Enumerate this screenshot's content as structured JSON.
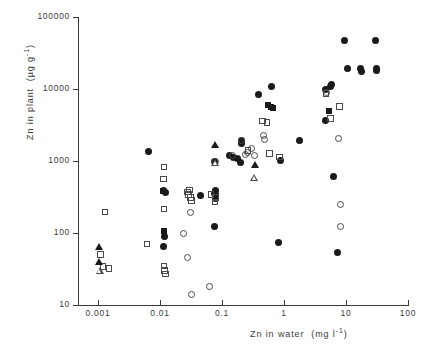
{
  "chart_data": {
    "type": "scatter",
    "title": "",
    "xlabel": "Zn in water  (mg l⁻¹)",
    "ylabel": "Zn in plant  (µg g⁻¹)",
    "xscale": "log",
    "yscale": "log",
    "xlim": [
      0.001,
      100
    ],
    "ylim": [
      10,
      100000
    ],
    "grid": false,
    "legend": "none",
    "xticks": [
      "0.001",
      "0.01",
      "0.1",
      "1",
      "10",
      "100"
    ],
    "xtick_values": [
      0.001,
      0.01,
      0.1,
      1,
      10,
      100
    ],
    "yticks": [
      "10",
      "100",
      "1000",
      "10000",
      "100000"
    ],
    "ytick_values": [
      10,
      100,
      1000,
      10000,
      100000
    ],
    "series": [
      {
        "name": "filled-circle",
        "marker": "filled circle",
        "points": [
          [
            0.0065,
            1350
          ],
          [
            0.0115,
            390
          ],
          [
            0.0122,
            370
          ],
          [
            0.0118,
            88
          ],
          [
            0.0115,
            64
          ],
          [
            0.045,
            330
          ],
          [
            0.075,
            1000
          ],
          [
            0.077,
            350
          ],
          [
            0.079,
            300
          ],
          [
            0.078,
            385
          ],
          [
            0.077,
            125
          ],
          [
            0.13,
            1180
          ],
          [
            0.155,
            1120
          ],
          [
            0.205,
            1750
          ],
          [
            0.21,
            1900
          ],
          [
            0.2,
            940
          ],
          [
            0.175,
            1100
          ],
          [
            0.39,
            8500
          ],
          [
            0.62,
            10800
          ],
          [
            0.82,
            74
          ],
          [
            0.88,
            1020
          ],
          [
            1.75,
            1950
          ],
          [
            4.6,
            9800
          ],
          [
            4.7,
            3600
          ],
          [
            5.6,
            11000
          ],
          [
            5.8,
            11400
          ],
          [
            6.2,
            600
          ],
          [
            7.4,
            53
          ],
          [
            9.5,
            47000
          ],
          [
            10.5,
            19000
          ],
          [
            17.0,
            19500
          ],
          [
            17.5,
            17500
          ],
          [
            30.0,
            47000
          ],
          [
            31.0,
            19000
          ],
          [
            31.5,
            17800
          ]
        ]
      },
      {
        "name": "open-circle",
        "marker": "open circle",
        "points": [
          [
            0.024,
            100
          ],
          [
            0.028,
            45
          ],
          [
            0.031,
            195
          ],
          [
            0.032,
            14
          ],
          [
            0.062,
            18
          ],
          [
            0.078,
            980
          ],
          [
            0.15,
            1200
          ],
          [
            0.21,
            1950
          ],
          [
            0.235,
            1250
          ],
          [
            0.26,
            1300
          ],
          [
            0.3,
            1500
          ],
          [
            0.335,
            1180
          ],
          [
            0.46,
            2250
          ],
          [
            0.48,
            2000
          ],
          [
            4.9,
            8800
          ],
          [
            7.7,
            2050
          ],
          [
            8.1,
            250
          ],
          [
            8.3,
            125
          ]
        ]
      },
      {
        "name": "filled-square",
        "marker": "filled square",
        "points": [
          [
            0.0112,
            380
          ],
          [
            0.0118,
            108
          ],
          [
            0.0795,
            330
          ],
          [
            0.55,
            5900
          ],
          [
            0.62,
            5700
          ],
          [
            0.66,
            5500
          ],
          [
            5.3,
            5000
          ]
        ]
      },
      {
        "name": "open-square",
        "marker": "open square",
        "points": [
          [
            0.0011,
            50
          ],
          [
            0.0012,
            34
          ],
          [
            0.0013,
            195
          ],
          [
            0.0015,
            32
          ],
          [
            0.0062,
            70
          ],
          [
            0.0115,
            830
          ],
          [
            0.0113,
            560
          ],
          [
            0.0116,
            215
          ],
          [
            0.0117,
            35
          ],
          [
            0.0119,
            30
          ],
          [
            0.0122,
            27
          ],
          [
            0.028,
            370
          ],
          [
            0.029,
            340
          ],
          [
            0.031,
            310
          ],
          [
            0.032,
            285
          ],
          [
            0.03,
            395
          ],
          [
            0.066,
            345
          ],
          [
            0.077,
            270
          ],
          [
            0.078,
            310
          ],
          [
            0.265,
            1400
          ],
          [
            0.45,
            3600
          ],
          [
            0.53,
            3400
          ],
          [
            0.58,
            1270
          ],
          [
            0.85,
            1130
          ],
          [
            4.8,
            8600
          ],
          [
            5.6,
            3900
          ],
          [
            7.9,
            5700
          ]
        ]
      },
      {
        "name": "filled-triangle",
        "marker": "filled triangle",
        "points": [
          [
            0.00105,
            65
          ],
          [
            0.00105,
            40
          ],
          [
            0.076,
            1700
          ],
          [
            0.335,
            900
          ]
        ]
      },
      {
        "name": "open-triangle",
        "marker": "open triangle",
        "points": [
          [
            0.00108,
            30
          ],
          [
            0.078,
            960
          ],
          [
            0.33,
            590
          ]
        ]
      }
    ]
  },
  "axes": {
    "y_title": "Zn in plant",
    "y_units": "µg g",
    "y_exp": "-1",
    "x_title": "Zn in water",
    "x_units": "mg l",
    "x_exp": "-1"
  }
}
